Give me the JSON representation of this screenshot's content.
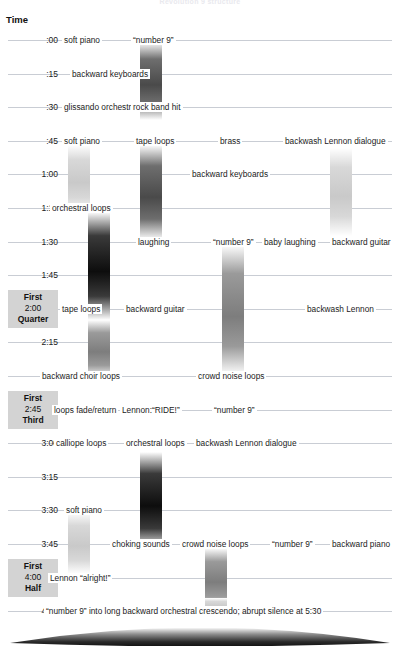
{
  "title": "Revolution 9 structure",
  "axis": {
    "label": "Time"
  },
  "chart_data": {
    "type": "timeline",
    "title": "Revolution 9 structure",
    "xlabel": "",
    "ylabel": "Time",
    "grid": true,
    "legend": "none",
    "ylim": [
      "0:00",
      "4:15"
    ],
    "tick_labels": [
      ":00",
      ":15",
      ":30",
      ":45",
      "1:00",
      "1:15",
      "1:30",
      "1:45",
      "2:00",
      "2:15",
      "2:30",
      "2:45",
      "3:00",
      "3:15",
      "3:30",
      "3:45",
      "4:00",
      "4:15"
    ],
    "markers": [
      {
        "time": "2:00",
        "top": "First",
        "bottom": "Quarter"
      },
      {
        "time": "2:45",
        "top": "First",
        "bottom": "Third"
      },
      {
        "time": "4:00",
        "top": "First",
        "bottom": "Half"
      }
    ],
    "rows": [
      {
        "time": ":00",
        "events": [
          "soft piano",
          "“number 9”"
        ]
      },
      {
        "time": ":15",
        "events": [
          "backward keyboards"
        ]
      },
      {
        "time": ":30",
        "events": [
          "glissando orchestra",
          "rock band hit"
        ]
      },
      {
        "time": ":45",
        "events": [
          "soft piano",
          "tape loops",
          "brass",
          "backwash Lennon dialogue"
        ]
      },
      {
        "time": "1:00",
        "events": [
          "backward keyboards"
        ]
      },
      {
        "time": "1:15",
        "events": [
          "orchestral loops"
        ]
      },
      {
        "time": "1:30",
        "events": [
          "laughing",
          "“number 9”",
          "baby laughing",
          "backward guitar"
        ]
      },
      {
        "time": "1:45",
        "events": []
      },
      {
        "time": "2:00",
        "events": [
          "tape loops",
          "backward guitar",
          "backwash Lennon"
        ]
      },
      {
        "time": "2:15",
        "events": []
      },
      {
        "time": "2:30",
        "events": [
          "backward choir loops",
          "crowd noise loops"
        ]
      },
      {
        "time": "2:45",
        "events": [
          "loops fade/return",
          "Lennon:“RIDE!”",
          "“number 9”"
        ]
      },
      {
        "time": "3:00",
        "events": [
          "calliope loops",
          "orchestral loops",
          "backwash Lennon dialogue"
        ]
      },
      {
        "time": "3:15",
        "events": []
      },
      {
        "time": "3:30",
        "events": [
          "soft piano"
        ]
      },
      {
        "time": "3:45",
        "events": [
          "choking sounds",
          "crowd noise loops",
          "“number 9”",
          "backward piano"
        ]
      },
      {
        "time": "4:00",
        "events": [
          "Lennon “alright!”"
        ]
      },
      {
        "time": "4:15",
        "events": [
          "“number 9” into long backward orchestral crescendo; abrupt silence at 5:30"
        ]
      }
    ],
    "bars": [
      {
        "name": "number-9-bar-1",
        "label": "“number 9”",
        "x": 140,
        "top": 42,
        "height": 78,
        "intensity": "dark"
      },
      {
        "name": "soft-piano-bar-1",
        "label": "soft piano",
        "x": 68,
        "top": 145,
        "height": 68,
        "intensity": "light"
      },
      {
        "name": "tape-loops-bar-1",
        "label": "tape loops",
        "x": 140,
        "top": 145,
        "height": 95,
        "intensity": "dark"
      },
      {
        "name": "backwash-lennon-bar-1",
        "label": "backwash Lennon dialogue",
        "x": 330,
        "top": 148,
        "height": 88,
        "intensity": "light"
      },
      {
        "name": "orchestral-loops-bar-1",
        "label": "orchestral loops",
        "x": 88,
        "top": 212,
        "height": 108,
        "intensity": "verydark"
      },
      {
        "name": "number-9-bar-2",
        "label": "“number 9”",
        "x": 222,
        "top": 245,
        "height": 130,
        "intensity": "mid"
      },
      {
        "name": "backward-choir-loops-bar",
        "label": "backward choir loops",
        "x": 88,
        "top": 320,
        "height": 58,
        "intensity": "mid"
      },
      {
        "name": "orchestral-loops-bar-2",
        "label": "orchestral loops",
        "x": 140,
        "top": 452,
        "height": 98,
        "intensity": "verydark"
      },
      {
        "name": "soft-piano-bar-2",
        "label": "soft piano",
        "x": 68,
        "top": 512,
        "height": 62,
        "intensity": "light"
      },
      {
        "name": "crowd-noise-loops-bar",
        "label": "crowd noise loops",
        "x": 205,
        "top": 548,
        "height": 62,
        "intensity": "mid"
      },
      {
        "name": "crescendo-bar",
        "label": "backward orchestral crescendo",
        "x": 205,
        "top": 598,
        "height": 16,
        "intensity": "light"
      }
    ]
  }
}
